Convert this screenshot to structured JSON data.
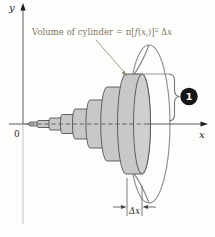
{
  "figure": {
    "formula": {
      "lead": "Volume of cylinder",
      "equals": " = ",
      "pi_bracket": "π[",
      "f": "f",
      "open_paren": "(",
      "x": "x",
      "sub_i": "i",
      "close_paren": ")",
      "close_bracket": "]",
      "sup_2": "2",
      "space_delta": " Δ",
      "x_after_delta": "x"
    },
    "axes": {
      "y_label": "y",
      "x_label": "x",
      "origin_label": "0",
      "axis_y": 124
    },
    "badge": {
      "label": "1",
      "fill": "#161616",
      "text_color": "#ffffff"
    },
    "dx_marker": {
      "label": "Δx"
    },
    "colors": {
      "disk_fill": "#c8c8c8",
      "disk_face_fill": "#cfcfcf",
      "disk_stroke": "#4c4c4c",
      "curve_stroke": "#858585",
      "bell_stroke": "#929292",
      "axis_stroke": "#5a5a5a",
      "axis_faint": "#bcbcbc",
      "annotation_color": "#82745f",
      "label_color": "#2e2e2e"
    },
    "disks": {
      "count": 8,
      "planes": [
        30,
        38,
        50,
        62,
        75,
        90,
        107,
        126,
        142
      ],
      "radii": [
        2,
        3.5,
        6,
        9.5,
        15,
        24,
        37,
        50
      ],
      "face_ry": 50,
      "face_rx": 8.5,
      "rx_ratio": 0.17
    }
  }
}
